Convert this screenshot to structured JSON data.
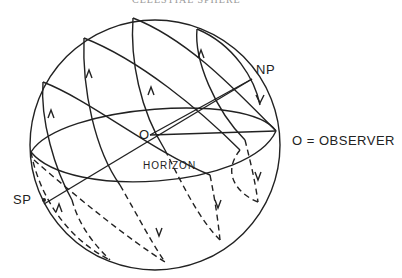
{
  "header": {
    "partial_title": "CELESTIAL SPHERE"
  },
  "labels": {
    "north_pole": "NP",
    "south_pole": "SP",
    "center": "O",
    "observer_key": "O = OBSERVER",
    "horizon": "HORIZON"
  },
  "colors": {
    "line": "#222222",
    "background": "#ffffff"
  }
}
